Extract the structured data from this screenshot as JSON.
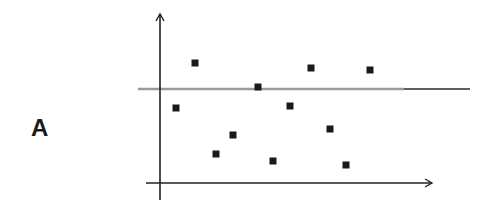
{
  "panel_label": "A",
  "colors": {
    "axis": "#222222",
    "point": "#1a1a1a",
    "reference_line_left": "#9a9a9a",
    "reference_line_right": "#2a2a2a"
  },
  "chart_data": {
    "type": "scatter",
    "title": "",
    "xlabel": "",
    "ylabel": "",
    "grid": false,
    "legend": null,
    "ticks": "none",
    "units": "pixel offsets from axes origin (no tick labels shown)",
    "xlim": [
      -14,
      272
    ],
    "ylim": [
      -17,
      169
    ],
    "reference_line": {
      "orientation": "horizontal",
      "y": 94,
      "x_start": -22,
      "x_end": 310
    },
    "points": [
      {
        "x": 35,
        "y": 120
      },
      {
        "x": 16,
        "y": 75
      },
      {
        "x": 56,
        "y": 29
      },
      {
        "x": 73,
        "y": 48
      },
      {
        "x": 98,
        "y": 96
      },
      {
        "x": 113,
        "y": 22
      },
      {
        "x": 130,
        "y": 77
      },
      {
        "x": 151,
        "y": 115
      },
      {
        "x": 170,
        "y": 54
      },
      {
        "x": 186,
        "y": 18
      },
      {
        "x": 210,
        "y": 113
      }
    ]
  }
}
